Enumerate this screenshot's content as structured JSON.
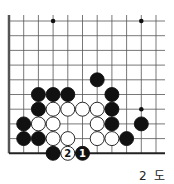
{
  "diagram": {
    "caption": "2 도",
    "grid": {
      "origin_x": 9,
      "origin_y": 21,
      "spacing": 14.7,
      "cols": 11,
      "rows": 10,
      "right_extent": 165,
      "left_edge_thick": true,
      "bottom_edge_thick": true
    },
    "star_points": [
      [
        3,
        0
      ],
      [
        9,
        0
      ],
      [
        9,
        6
      ]
    ],
    "stones": [
      {
        "c": 6,
        "r": 4,
        "color": "black"
      },
      {
        "c": 2,
        "r": 5,
        "color": "black"
      },
      {
        "c": 3,
        "r": 5,
        "color": "black"
      },
      {
        "c": 4,
        "r": 5,
        "color": "black"
      },
      {
        "c": 7,
        "r": 5,
        "color": "black"
      },
      {
        "c": 2,
        "r": 6,
        "color": "black"
      },
      {
        "c": 3,
        "r": 6,
        "color": "white"
      },
      {
        "c": 4,
        "r": 6,
        "color": "white"
      },
      {
        "c": 5,
        "r": 6,
        "color": "white"
      },
      {
        "c": 6,
        "r": 6,
        "color": "white"
      },
      {
        "c": 7,
        "r": 6,
        "color": "black"
      },
      {
        "c": 1,
        "r": 7,
        "color": "black"
      },
      {
        "c": 2,
        "r": 7,
        "color": "white"
      },
      {
        "c": 3,
        "r": 7,
        "color": "white"
      },
      {
        "c": 6,
        "r": 7,
        "color": "white"
      },
      {
        "c": 7,
        "r": 7,
        "color": "black"
      },
      {
        "c": 9,
        "r": 7,
        "color": "black"
      },
      {
        "c": 1,
        "r": 8,
        "color": "black"
      },
      {
        "c": 2,
        "r": 8,
        "color": "black"
      },
      {
        "c": 3,
        "r": 8,
        "color": "white"
      },
      {
        "c": 4,
        "r": 8,
        "color": "white"
      },
      {
        "c": 6,
        "r": 8,
        "color": "white"
      },
      {
        "c": 7,
        "r": 8,
        "color": "white"
      },
      {
        "c": 8,
        "r": 8,
        "color": "black"
      },
      {
        "c": 3,
        "r": 9,
        "color": "black"
      },
      {
        "c": 4,
        "r": 9,
        "color": "white",
        "label": "2"
      },
      {
        "c": 5,
        "r": 9,
        "color": "black",
        "label": "1"
      }
    ]
  }
}
